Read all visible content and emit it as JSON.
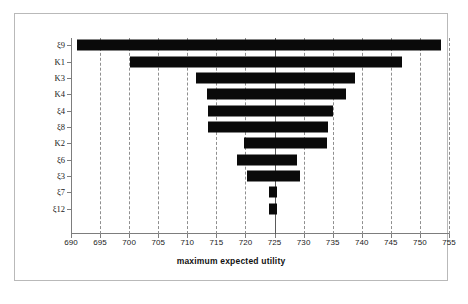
{
  "chart_data": {
    "type": "bar",
    "orientation": "horizontal",
    "title": "",
    "xlabel": "maximum expected utility",
    "ylabel": "",
    "xlim": [
      690,
      755
    ],
    "xticks": [
      690,
      695,
      700,
      705,
      710,
      715,
      720,
      725,
      730,
      735,
      740,
      745,
      750,
      755
    ],
    "grid": "vertical-dashed",
    "legend": "none",
    "categories": [
      "ξ9",
      "K1",
      "K3",
      "K4",
      "ξ4",
      "ξ8",
      "K2",
      "ξ6",
      "ξ3",
      "ξ7",
      "ξ12"
    ],
    "bars": [
      {
        "label": "ξ9",
        "start": 691.0,
        "end": 753.6
      },
      {
        "label": "K1",
        "start": 700.1,
        "end": 746.9
      },
      {
        "label": "K3",
        "start": 711.5,
        "end": 738.8
      },
      {
        "label": "K4",
        "start": 713.4,
        "end": 737.3
      },
      {
        "label": "ξ4",
        "start": 713.6,
        "end": 735.1
      },
      {
        "label": "ξ8",
        "start": 713.6,
        "end": 734.2
      },
      {
        "label": "K2",
        "start": 719.7,
        "end": 734.0
      },
      {
        "label": "ξ6",
        "start": 718.5,
        "end": 728.9
      },
      {
        "label": "ξ3",
        "start": 720.3,
        "end": 729.4
      },
      {
        "label": "ξ7",
        "start": 724.1,
        "end": 725.4
      },
      {
        "label": "ξ12",
        "start": 724.1,
        "end": 725.4
      }
    ],
    "bar_color": "#0a0a0a",
    "grid_color": "#8f8f8f",
    "axis_color": "#7d7d7d"
  }
}
